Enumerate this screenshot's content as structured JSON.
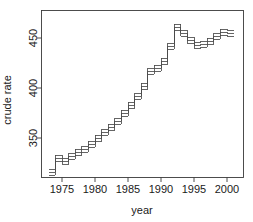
{
  "chart_data": {
    "type": "line",
    "subtype": "step-with-confidence-bands",
    "title": "",
    "xlabel": "year",
    "ylabel": "crude rate",
    "xlim": [
      1973,
      2001
    ],
    "ylim": [
      313,
      472
    ],
    "xticks": [
      1975,
      1980,
      1985,
      1990,
      1995,
      2000
    ],
    "yticks": [
      350,
      400,
      450
    ],
    "xtick_labels": [
      "1975",
      "1980",
      "1985",
      "1990",
      "1995",
      "2000"
    ],
    "ytick_labels": [
      "350",
      "400",
      "450"
    ],
    "grid": false,
    "legend": false,
    "box": true,
    "x": [
      1973,
      1974,
      1975,
      1976,
      1977,
      1978,
      1979,
      1980,
      1981,
      1982,
      1983,
      1984,
      1985,
      1986,
      1987,
      1988,
      1989,
      1990,
      1991,
      1992,
      1993,
      1994,
      1995,
      1996,
      1997,
      1998,
      1999,
      2000
    ],
    "series": [
      {
        "name": "crude rate (estimate)",
        "values": [
          316,
          330,
          327,
          332,
          336,
          339,
          344,
          350,
          356,
          361,
          367,
          375,
          383,
          392,
          402,
          417,
          420,
          427,
          442,
          461,
          455,
          448,
          443,
          444,
          447,
          452,
          456,
          455
        ]
      },
      {
        "name": "upper confidence limit",
        "values": [
          319,
          333,
          330,
          335,
          339,
          342,
          347,
          353,
          359,
          364,
          370,
          378,
          386,
          395,
          405,
          420,
          423,
          430,
          445,
          464,
          458,
          451,
          446,
          447,
          450,
          455,
          459,
          458
        ]
      },
      {
        "name": "lower confidence limit",
        "values": [
          313,
          327,
          324,
          329,
          333,
          336,
          341,
          347,
          353,
          358,
          364,
          372,
          380,
          389,
          399,
          414,
          417,
          424,
          439,
          458,
          452,
          445,
          440,
          441,
          444,
          449,
          453,
          452
        ]
      }
    ]
  },
  "axes": {
    "x_title": "year",
    "y_title": "crude rate"
  }
}
